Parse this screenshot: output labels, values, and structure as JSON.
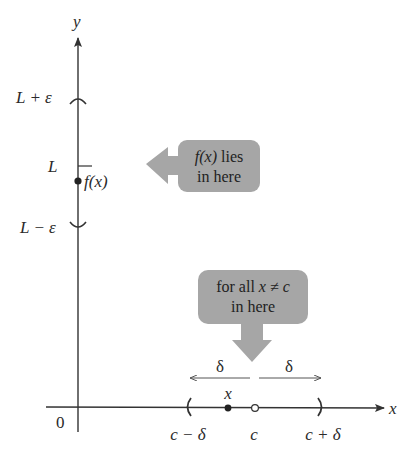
{
  "diagram": {
    "axes": {
      "x_label": "x",
      "y_label": "y",
      "origin_label": "0"
    },
    "y_axis_marks": {
      "upper": "L + ε",
      "middle": "L",
      "lower": "L − ε",
      "point_label": "f(x)"
    },
    "x_axis_marks": {
      "left": "c − δ",
      "center": "c",
      "right": "c + δ",
      "point_label": "x"
    },
    "delta_labels": {
      "left": "δ",
      "right": "δ"
    },
    "callouts": {
      "fx_bubble": {
        "line1_italic": "f(x)",
        "line1_rest": " lies",
        "line2": "in here"
      },
      "x_bubble": {
        "line1_prefix": "for all ",
        "line1_math": "x ≠ c",
        "line2": "in here"
      }
    },
    "colors": {
      "axis": "#333333",
      "bubble_fill": "#a6a6a6",
      "text": "#2a2a2a",
      "delta_arrow": "#555555"
    }
  }
}
